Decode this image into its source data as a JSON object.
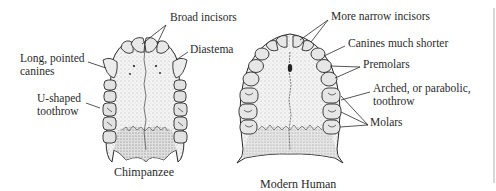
{
  "figure": {
    "specimens": [
      {
        "name": "Chimpanzee",
        "caption": "Chimpanzee",
        "labels": {
          "incisors": "Broad incisors",
          "diastema": "Diastema",
          "canines_line1": "Long, pointed",
          "canines_line2": "canines",
          "toothrow_line1": "U-shaped",
          "toothrow_line2": "toothrow"
        }
      },
      {
        "name": "Modern Human",
        "caption": "Modern Human",
        "labels": {
          "incisors": "More narrow incisors",
          "canines": "Canines much shorter",
          "premolars": "Premolars",
          "toothrow_line1": "Arched, or parabolic,",
          "toothrow_line2": "toothrow",
          "molars": "Molars"
        }
      }
    ],
    "colors": {
      "ink": "#2a2a2a",
      "palate_fill": "#f2f2f2",
      "tooth_fill": "#e6e6e6",
      "background": "#ffffff"
    }
  }
}
